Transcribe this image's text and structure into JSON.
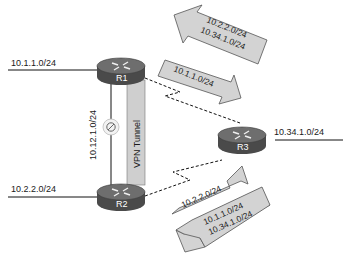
{
  "diagram": {
    "routers": [
      {
        "id": "R1",
        "label": "R1",
        "network": "10.1.1.0/24"
      },
      {
        "id": "R2",
        "label": "R2",
        "network": "10.2.2.0/24"
      },
      {
        "id": "R3",
        "label": "R3",
        "network": "10.34.1.0/24"
      }
    ],
    "links": [
      {
        "from": "R1",
        "to": "R2",
        "label": "10.12.1.0/24",
        "status": "blocked",
        "icon": "blocked-icon"
      },
      {
        "from": "R1",
        "to": "R2",
        "label": "VPN Tunnel",
        "type": "tunnel"
      },
      {
        "from": "R1",
        "to": "R3",
        "type": "serial-dashed"
      },
      {
        "from": "R2",
        "to": "R3",
        "type": "serial-dashed"
      }
    ],
    "route_advertisements": [
      {
        "direction": "R3-to-R1",
        "routes": [
          "10.2.2.0/24",
          "10.34.1.0/24"
        ]
      },
      {
        "direction": "R1-to-R3",
        "routes": [
          "10.1.1.0/24"
        ]
      },
      {
        "direction": "R2-to-R3",
        "routes": [
          "10.2.2.0/24"
        ]
      },
      {
        "direction": "R3-to-R2",
        "routes": [
          "10.1.1.0/24",
          "10.34.1.0/24"
        ]
      }
    ],
    "colors": {
      "router_body": "#4a4a4a",
      "router_top": "#6e6e6e",
      "arrow_fill": "#d3d3d3",
      "tunnel_fill": "#cfcfcf",
      "line": "#111111"
    }
  }
}
